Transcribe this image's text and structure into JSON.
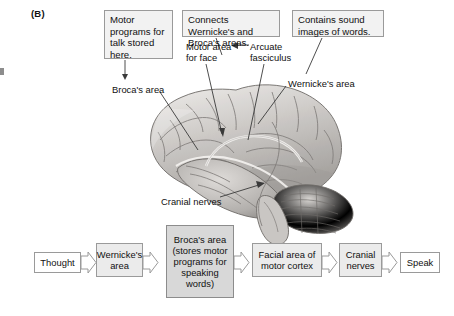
{
  "figure": {
    "panel_letter": "(B)"
  },
  "callouts": [
    {
      "id": "motor-programs",
      "text": "Motor programs for talk stored here."
    },
    {
      "id": "connects-areas",
      "text": "Connects Wernicke's and Broca's areas."
    },
    {
      "id": "sound-images",
      "text": "Contains sound images of words."
    }
  ],
  "brain_labels": [
    {
      "id": "motor-area-for-face",
      "text": "Motor area\nfor face"
    },
    {
      "id": "arcuate-fasciculus",
      "text": "Arcuate\nfasciculus"
    },
    {
      "id": "brocas-area",
      "text": "Broca's area"
    },
    {
      "id": "wernickes-area",
      "text": "Wernicke's area"
    },
    {
      "id": "cranial-nerves",
      "text": "Cranial nerves"
    }
  ],
  "illustration": {
    "name": "lateral-view-human-brain",
    "description": "Grayscale lateral view of the human brain with cerebellum and brainstem",
    "colors": {
      "cortex_light": "#e6e4e2",
      "cortex_mid": "#b9b6b3",
      "cortex_dark": "#8e8b88",
      "outline": "#6e6b68"
    }
  },
  "flowchart": {
    "steps": [
      {
        "id": "thought",
        "label": "Thought",
        "style": "plain"
      },
      {
        "id": "wernicke",
        "label": "Wernicke's area",
        "style": "shaded"
      },
      {
        "id": "broca",
        "label": "Broca's area (stores motor programs for speaking words)",
        "style": "shaded-dark"
      },
      {
        "id": "facial",
        "label": "Facial area of motor cortex",
        "style": "shaded"
      },
      {
        "id": "cranial",
        "label": "Cranial nerves",
        "style": "shaded"
      },
      {
        "id": "speak",
        "label": "Speak",
        "style": "plain"
      }
    ],
    "arrow_count": 5
  },
  "colors": {
    "box_border": "#9a9a9a",
    "callout_fill": "#f2f2f2",
    "shaded_fill": "#ebebeb",
    "shaded_dark_fill": "#d8d8d8",
    "leader_line": "#3a3a3a",
    "text": "#111111"
  }
}
